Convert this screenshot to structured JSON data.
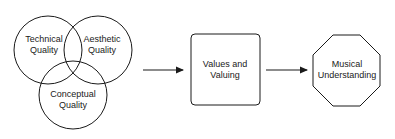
{
  "diagram": {
    "venn": {
      "circles": [
        {
          "label": "Technical\nQuality",
          "cx": 48,
          "cy": 50,
          "r": 34
        },
        {
          "label": "Aesthetic\nQuality",
          "cx": 98,
          "cy": 50,
          "r": 34
        },
        {
          "label": "Conceptual\nQuality",
          "cx": 73,
          "cy": 95,
          "r": 34
        }
      ]
    },
    "box": {
      "label": "Values and\nValuing"
    },
    "octagon": {
      "label": "Musical\nUnderstanding"
    },
    "arrows": [
      {
        "from": "venn",
        "to": "box"
      },
      {
        "from": "box",
        "to": "octagon"
      }
    ],
    "colors": {
      "stroke": "#1a1a1a",
      "background": "#ffffff"
    }
  }
}
